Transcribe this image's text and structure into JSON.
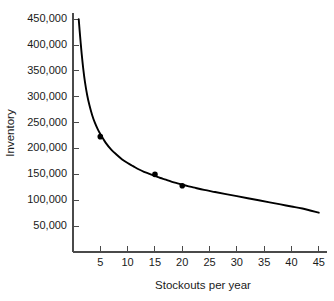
{
  "chart_data": {
    "type": "line",
    "title": "",
    "xlabel": "Stockouts per year",
    "ylabel": "Inventory",
    "xlim": [
      0,
      46.5
    ],
    "ylim": [
      0,
      462000
    ],
    "grid": false,
    "legend": null,
    "x_ticks": [
      5,
      10,
      15,
      20,
      25,
      30,
      35,
      40,
      45
    ],
    "x_tick_labels": [
      "5",
      "10",
      "15",
      "20",
      "25",
      "30",
      "35",
      "40",
      "45"
    ],
    "y_ticks": [
      50000,
      100000,
      150000,
      200000,
      250000,
      300000,
      350000,
      400000,
      450000
    ],
    "y_tick_labels": [
      "50,000",
      "100,000",
      "150,000",
      "200,000",
      "250,000",
      "300,000",
      "350,000",
      "400,000",
      "450,000"
    ],
    "series": [
      {
        "name": "fitted-curve",
        "kind": "line",
        "color": "#000000",
        "x": [
          1.05,
          1.2,
          1.4,
          1.6,
          1.9,
          2.2,
          2.6,
          3.0,
          3.5,
          4.0,
          4.5,
          5.0,
          6.0,
          7.0,
          8.0,
          9.0,
          10.0,
          11.0,
          12.0,
          13.0,
          14.0,
          15.0,
          16.0,
          17.0,
          18.0,
          19.0,
          20.0,
          22.0,
          24.0,
          26.0,
          28.0,
          30.0,
          32.0,
          34.0,
          36.0,
          38.0,
          40.0,
          42.0,
          45.0
        ],
        "y": [
          450000,
          430000,
          405000,
          382000,
          352000,
          328000,
          303000,
          284000,
          265000,
          250000,
          238000,
          228000,
          211000,
          198000,
          188000,
          179000,
          172000,
          166000,
          160000,
          155000,
          151000,
          147000,
          143000,
          140000,
          136000,
          133000,
          130000,
          125000,
          120000,
          116000,
          112000,
          108000,
          104000,
          100000,
          96000,
          92000,
          88000,
          84000,
          76000
        ]
      },
      {
        "name": "observations",
        "kind": "scatter",
        "color": "#000000",
        "x": [
          5,
          15,
          20
        ],
        "y": [
          223000,
          150000,
          128000
        ]
      }
    ]
  }
}
